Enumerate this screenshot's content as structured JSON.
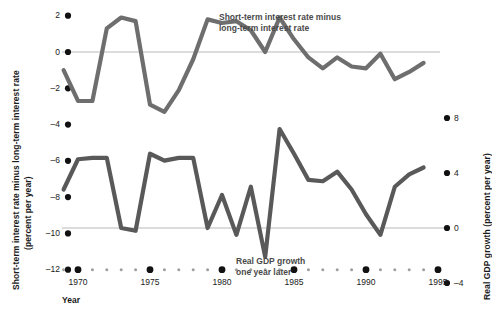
{
  "chart_data": {
    "type": "line",
    "title": "",
    "xlabel": "Year",
    "x_tick_labels": [
      "1970",
      "1975",
      "1980",
      "1985",
      "1990",
      "1995"
    ],
    "x_major_ticks": [
      1970,
      1975,
      1980,
      1985,
      1990,
      1995
    ],
    "xlim": [
      1968.5,
      1995.5
    ],
    "grid": false,
    "legend_position": "inline-annotations",
    "left_axis": {
      "label_line1": "Short-term interest rate minus long-term interest rate",
      "label_line2": "(percent per year)",
      "ticks": [
        2,
        0,
        -2,
        -4,
        -6,
        -8,
        -10,
        -12
      ],
      "tick_labels": [
        "2",
        "0",
        "-2",
        "-4",
        "-6",
        "-8",
        "-10",
        "-12"
      ],
      "ylim": [
        -12,
        2
      ],
      "zero_line_value": 0
    },
    "right_axis": {
      "label": "Real GDP growth (percent per year)",
      "ticks": [
        8,
        4,
        0,
        -4
      ],
      "tick_labels": [
        "8",
        "4",
        "0",
        "-4"
      ],
      "ylim": [
        -4,
        9.6
      ],
      "zero_line_value": 0
    },
    "series": [
      {
        "name": "Short-term interest rate minus long-term interest rate",
        "annotation": "Short-term interest rate minus\nlong-term interest rate",
        "axis": "left",
        "color": "#6e6e6e",
        "x": [
          1969,
          1970,
          1971,
          1972,
          1973,
          1974,
          1975,
          1976,
          1977,
          1978,
          1979,
          1980,
          1981,
          1982,
          1983,
          1984,
          1985,
          1986,
          1987,
          1988,
          1989,
          1990,
          1991,
          1992,
          1993,
          1994
        ],
        "values": [
          -1.0,
          -2.7,
          -2.7,
          1.3,
          1.9,
          1.7,
          -2.9,
          -3.3,
          -2.1,
          -0.4,
          1.8,
          1.6,
          1.7,
          1.2,
          0.0,
          1.9,
          0.7,
          -0.3,
          -0.9,
          -0.3,
          -0.8,
          -0.9,
          -0.1,
          -1.5,
          -1.1,
          -0.6
        ]
      },
      {
        "name": "Real GDP growth one year later",
        "annotation": "Real GDP growth\none year later",
        "axis": "right",
        "color": "#595959",
        "x": [
          1969,
          1970,
          1971,
          1972,
          1973,
          1974,
          1975,
          1976,
          1977,
          1978,
          1979,
          1980,
          1981,
          1982,
          1983,
          1984,
          1985,
          1986,
          1987,
          1988,
          1989,
          1990,
          1991,
          1992,
          1993,
          1994
        ],
        "values": [
          2.8,
          5.0,
          5.1,
          5.1,
          0.0,
          -0.2,
          5.4,
          4.9,
          5.1,
          5.1,
          0.0,
          2.4,
          -0.5,
          3.0,
          -2.1,
          7.2,
          5.4,
          3.5,
          3.4,
          4.1,
          2.8,
          1.0,
          -0.5,
          3.0,
          3.9,
          4.4
        ]
      }
    ],
    "annotations": [
      {
        "name": "spread-series-label",
        "text_line1": "Short-term interest rate minus",
        "text_line2": "long-term interest rate"
      },
      {
        "name": "gdp-series-label",
        "text_line1": "Real GDP growth",
        "text_line2": "one year later"
      }
    ],
    "colors": {
      "spread_line": "#6e6e6e",
      "gdp_line": "#595959",
      "zero_line": "#b9b9b9",
      "tick_dot": "#111111",
      "minor_tick_dot": "#9e9e9e",
      "text": "#1a1a1a",
      "annotation_text": "#4a4a4a",
      "background": "#ffffff"
    }
  }
}
